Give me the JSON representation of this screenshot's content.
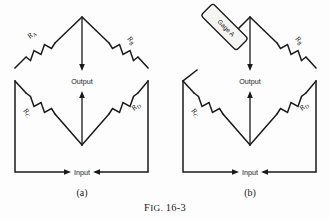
{
  "figure": {
    "caption_prefix": "F",
    "caption_small": "IG.",
    "caption_number": "16-3",
    "caption_full": "FIG. 16-3",
    "background_color": "#fdfdfd",
    "ink_color": "#1a1a1a"
  },
  "panels": [
    {
      "id": "a",
      "label": "(a)",
      "terminals": {
        "output": "Output",
        "input": "Input"
      },
      "elements": [
        {
          "name": "resistor-ra",
          "type": "resistor",
          "label_letter": "R",
          "label_sub": "A",
          "arm": "upper-left"
        },
        {
          "name": "resistor-rb",
          "type": "resistor",
          "label_letter": "R",
          "label_sub": "B",
          "arm": "upper-right"
        },
        {
          "name": "resistor-rc",
          "type": "resistor",
          "label_letter": "R",
          "label_sub": "C",
          "arm": "lower-left"
        },
        {
          "name": "resistor-rd",
          "type": "resistor",
          "label_letter": "R",
          "label_sub": "D",
          "arm": "lower-right"
        }
      ]
    },
    {
      "id": "b",
      "label": "(b)",
      "terminals": {
        "output": "Output",
        "input": "Input"
      },
      "elements": [
        {
          "name": "strain-gage-a",
          "type": "gage",
          "label": "Gage A",
          "arm": "upper-left",
          "fill": "#f4f4f2"
        },
        {
          "name": "resistor-rb",
          "type": "resistor",
          "label_letter": "R",
          "label_sub": "B",
          "arm": "upper-right"
        },
        {
          "name": "resistor-rc",
          "type": "resistor",
          "label_letter": "R",
          "label_sub": "C",
          "arm": "lower-left"
        },
        {
          "name": "resistor-rd",
          "type": "resistor",
          "label_letter": "R",
          "label_sub": "D",
          "arm": "lower-right"
        }
      ]
    }
  ]
}
